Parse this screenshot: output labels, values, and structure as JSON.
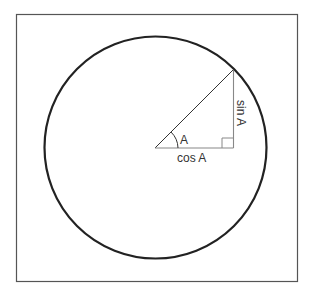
{
  "diagram": {
    "colors": {
      "frame": "#555555",
      "circle": "#222222",
      "triangle": "#888888",
      "hypotenuse": "#333333",
      "text": "#333333"
    },
    "labels": {
      "angle": "A",
      "adjacent": "cos A",
      "opposite": "sin A"
    }
  }
}
